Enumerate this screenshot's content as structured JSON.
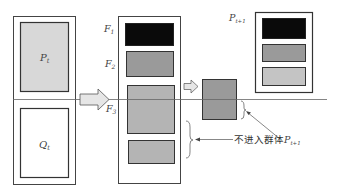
{
  "diagram": {
    "type": "nsga-ii-selection",
    "left_column": {
      "top_label": "P",
      "top_sub": "t",
      "bottom_label": "Q",
      "bottom_sub": "t"
    },
    "fronts": [
      {
        "label": "F",
        "sub": "1",
        "color": "#0a0a0a"
      },
      {
        "label": "F",
        "sub": "2",
        "color": "#9a9a9a"
      },
      {
        "label": "F",
        "sub": "3",
        "color": "#b4b4b4"
      }
    ],
    "next_population": {
      "label": "P",
      "sub": "t+1",
      "boxes": [
        "#0a0a0a",
        "#9a9a9a",
        "#c4c4c4"
      ]
    },
    "annotation": {
      "text": "不进入群体",
      "label": "P",
      "sub": "t+1"
    },
    "colors": {
      "line": "#555555",
      "light_fill": "#d8d8d8",
      "arrow_fill": "#e6e6e6"
    }
  }
}
